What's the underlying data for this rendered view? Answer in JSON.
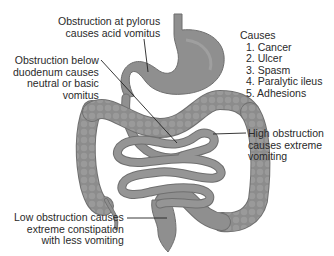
{
  "diagram": {
    "type": "anatomical illustration",
    "colors": {
      "organ_fill": "#8f8f8f",
      "organ_shade": "#6f6f6f",
      "organ_highlight": "#a9a9a9",
      "leader_line": "#222222",
      "text": "#2a2a2a",
      "background": "#ffffff"
    }
  },
  "labels": {
    "pylorus": {
      "lines": [
        "Obstruction at pylorus",
        "causes acid vomitus"
      ]
    },
    "duodenum": {
      "lines": [
        "Obstruction below",
        "duodenum causes",
        "neutral or basic",
        "vomitus"
      ]
    },
    "high": {
      "lines": [
        "High obstruction",
        "causes extreme",
        "vomiting"
      ]
    },
    "low": {
      "lines": [
        "Low obstruction causes",
        "extreme constipation",
        "with less vomiting"
      ]
    }
  },
  "causes": {
    "title": "Causes",
    "items": [
      "1. Cancer",
      "2. Ulcer",
      "3. Spasm",
      "4. Paralytic ileus",
      "5. Adhesions"
    ]
  }
}
